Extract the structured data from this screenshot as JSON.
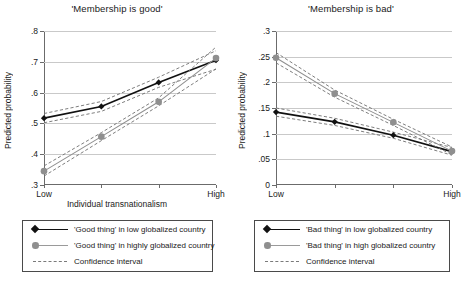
{
  "chart_data": [
    {
      "type": "line",
      "panel": "left",
      "title": "'Membership is good'",
      "xlabel": "Individual transnationalism",
      "ylabel": "Predicted probability",
      "x": [
        0,
        1,
        2,
        3
      ],
      "xtick_labels": [
        "Low",
        "",
        "",
        "High"
      ],
      "ytick_labels": [
        ".8",
        ".7",
        ".6",
        ".5",
        ".4",
        ".3"
      ],
      "ylim": [
        0.3,
        0.8
      ],
      "grid": true,
      "legend_position": "below",
      "series": [
        {
          "name": "'Good thing' in low globalized country",
          "color": "#111111",
          "marker": "diamond",
          "values": [
            0.517,
            0.555,
            0.633,
            0.705
          ],
          "ci_upper": [
            0.532,
            0.571,
            0.65,
            0.736
          ],
          "ci_lower": [
            0.502,
            0.539,
            0.617,
            0.676
          ]
        },
        {
          "name": "'Good thing' in highly globalized country",
          "color": "#8f8f8f",
          "marker": "circle",
          "values": [
            0.345,
            0.457,
            0.57,
            0.712
          ],
          "ci_upper": [
            0.362,
            0.47,
            0.583,
            0.748
          ],
          "ci_lower": [
            0.329,
            0.444,
            0.557,
            0.677
          ]
        }
      ],
      "ci_label": "Confidence interval"
    },
    {
      "type": "line",
      "panel": "right",
      "title": "'Membership is bad'",
      "xlabel": "Individual transnationalism",
      "ylabel": "Predicted probability",
      "x": [
        0,
        1,
        2,
        3
      ],
      "xtick_labels": [
        "Low",
        "",
        "",
        "High"
      ],
      "ytick_labels": [
        ".3",
        ".25",
        ".2",
        ".15",
        ".1",
        ".05",
        "0"
      ],
      "ylim": [
        0,
        0.3
      ],
      "grid": true,
      "legend_position": "below",
      "series": [
        {
          "name": "'Bad thing' in low globalized country",
          "color": "#111111",
          "marker": "diamond",
          "values": [
            0.142,
            0.123,
            0.097,
            0.065
          ],
          "ci_upper": [
            0.15,
            0.13,
            0.103,
            0.073
          ],
          "ci_lower": [
            0.134,
            0.116,
            0.091,
            0.058
          ]
        },
        {
          "name": "'Bad thing' in high globalized country",
          "color": "#8f8f8f",
          "marker": "circle",
          "values": [
            0.248,
            0.178,
            0.122,
            0.066
          ],
          "ci_upper": [
            0.258,
            0.185,
            0.128,
            0.074
          ],
          "ci_lower": [
            0.238,
            0.171,
            0.116,
            0.059
          ]
        }
      ],
      "ci_label": "Confidence interval"
    }
  ],
  "left_panel": {
    "title": "'Membership is good'",
    "ylabel": "Predicted probability",
    "xlabel": "Individual transnationalism",
    "ytick_labels": [
      ".8",
      ".7",
      ".6",
      ".5",
      ".4",
      ".3"
    ],
    "xtick_labels": [
      "Low",
      "High"
    ],
    "legend": [
      "'Good thing' in low globalized country",
      "'Good thing' in highly globalized country",
      "Confidence interval"
    ]
  },
  "right_panel": {
    "title": "'Membership is bad'",
    "ylabel": "Predicted probability",
    "xlabel": "Individual transnationalism",
    "ytick_labels": [
      ".3",
      ".25",
      ".2",
      ".15",
      ".1",
      ".05",
      "0"
    ],
    "xtick_labels": [
      "Low",
      "High"
    ],
    "legend": [
      "'Bad thing' in low globalized country",
      "'Bad thing' in high globalized country",
      "Confidence interval"
    ]
  },
  "colors": {
    "series_dark": "#111111",
    "series_light": "#8f8f8f",
    "gridline": "#c9c9c9",
    "axis": "#6b6b6b"
  }
}
